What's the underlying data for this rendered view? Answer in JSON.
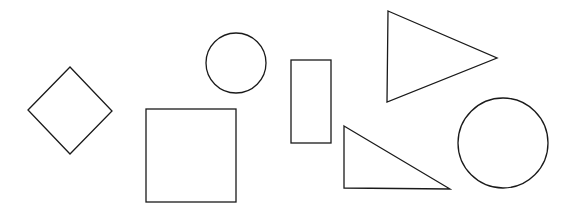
{
  "canvas": {
    "width": 571,
    "height": 210,
    "background": "#ffffff",
    "stroke": "#1a1a1a"
  },
  "shapes": [
    {
      "type": "diamond",
      "points": "28,110 70,67 112,111 70,154"
    },
    {
      "type": "circle",
      "cx": 236,
      "cy": 63,
      "r": 30
    },
    {
      "type": "square",
      "x": 146,
      "y": 109,
      "width": 90,
      "height": 93
    },
    {
      "type": "rectangle",
      "x": 291,
      "y": 60,
      "width": 40,
      "height": 83
    },
    {
      "type": "triangle",
      "points": "388,11 497,58 387,102"
    },
    {
      "type": "right-triangle",
      "points": "344,126 450,189 344,188"
    },
    {
      "type": "circle",
      "cx": 503,
      "cy": 143,
      "r": 45
    }
  ]
}
